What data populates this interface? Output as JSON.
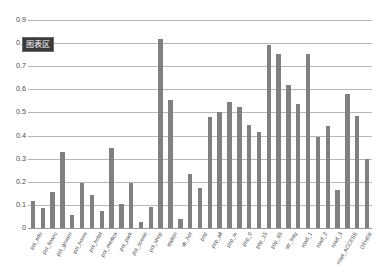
{
  "badge": {
    "label": "图表区"
  },
  "chart_data": {
    "type": "bar",
    "title": "",
    "xlabel": "",
    "ylabel": "",
    "ylim": [
      0,
      0.9
    ],
    "grid": true,
    "legend": "none",
    "bar_color": "#808080",
    "gridline_color": "#b7b7b7",
    "yticks": [
      "0",
      "0.1",
      "0.2",
      "0.3",
      "0.4",
      "0.5",
      "0.6",
      "0.7",
      "0.8",
      "0.9"
    ],
    "ytick_values": [
      0,
      0.1,
      0.2,
      0.3,
      0.4,
      0.5,
      0.6,
      0.7,
      0.8,
      0.9
    ],
    "categories": [
      "poi_edu",
      "poi_finan",
      "poi_govern",
      "poi_home",
      "poi_hotel",
      "poi_medica",
      "poi_park",
      "poi_scenic",
      "poi_shop",
      "station",
      "sb_hot",
      "pop",
      "pop_all",
      "pop_m",
      "pop_0",
      "pop_15",
      "pop_65",
      "str_fmly",
      "road_1",
      "road_2",
      "road_3",
      "road_ACCESS",
      "OTHER"
    ],
    "values": [
      0.115,
      0.085,
      0.33,
      0.195,
      0.145,
      0.345,
      0.105,
      0.09,
      0.115,
      0.82,
      0.125,
      0.235,
      0.48,
      0.545,
      0.525,
      0.445,
      0.79,
      0.755,
      0.62,
      0.54,
      0.395,
      0.58,
      0.3
    ],
    "series": [
      {
        "name": "series-1",
        "values": [
          0.115,
          0.085,
          0.33,
          0.195,
          0.145,
          0.345,
          0.105,
          0.09,
          0.115,
          0.82,
          0.125,
          0.235,
          0.48,
          0.545,
          0.525,
          0.445,
          0.79,
          0.755,
          0.62,
          0.54,
          0.395,
          0.58,
          0.3
        ]
      }
    ],
    "bars": [
      {
        "label": "poi_edu",
        "value": 0.115
      },
      {
        "label": "poi_edu_b",
        "value": 0.085
      },
      {
        "label": "poi_financ",
        "value": 0.155
      },
      {
        "label": "poi_govern",
        "value": 0.33
      },
      {
        "label": "poi_govern_b",
        "value": 0.055
      },
      {
        "label": "poi_home",
        "value": 0.195
      },
      {
        "label": "poi_hotel",
        "value": 0.145
      },
      {
        "label": "poi_hotel_b",
        "value": 0.075
      },
      {
        "label": "poi_medica",
        "value": 0.345
      },
      {
        "label": "poi_park",
        "value": 0.105
      },
      {
        "label": "poi_park_b",
        "value": 0.195
      },
      {
        "label": "poi_scenic",
        "value": 0.025
      },
      {
        "label": "poi_shop",
        "value": 0.09
      },
      {
        "label": "station",
        "value": 0.82
      },
      {
        "label": "station_b",
        "value": 0.555
      },
      {
        "label": "sb_hot",
        "value": 0.04
      },
      {
        "label": "sb_hot_b",
        "value": 0.235
      },
      {
        "label": "pop",
        "value": 0.175
      },
      {
        "label": "pop_all",
        "value": 0.48
      },
      {
        "label": "pop_all_b",
        "value": 0.5
      },
      {
        "label": "pop_m",
        "value": 0.545
      },
      {
        "label": "pop_m_b",
        "value": 0.525
      },
      {
        "label": "pop_0",
        "value": 0.445
      },
      {
        "label": "pop_0_b",
        "value": 0.415
      },
      {
        "label": "pop_15",
        "value": 0.79
      },
      {
        "label": "pop_15_b",
        "value": 0.755
      },
      {
        "label": "pop_65",
        "value": 0.62
      },
      {
        "label": "str_fmly",
        "value": 0.535
      },
      {
        "label": "str_fmly_b",
        "value": 0.755
      },
      {
        "label": "road_1",
        "value": 0.395
      },
      {
        "label": "road_1_b",
        "value": 0.44
      },
      {
        "label": "road_2",
        "value": 0.165
      },
      {
        "label": "road_3",
        "value": 0.58
      },
      {
        "label": "road_ACCESS",
        "value": 0.485
      },
      {
        "label": "OTHER",
        "value": 0.3
      }
    ],
    "xtick_labels": [
      "poi_edu",
      "poi_financ",
      "poi_govern",
      "poi_home",
      "poi_hotel",
      "poi_medica",
      "poi_park",
      "poi_scenic",
      "poi_shop",
      "station",
      "sb_hot",
      "pop",
      "pop_all",
      "pop_m",
      "pop_0",
      "pop_15",
      "pop_65",
      "str_fmly",
      "road_1",
      "road_2",
      "road_3",
      "road_ACCESS",
      "OTHER"
    ]
  }
}
